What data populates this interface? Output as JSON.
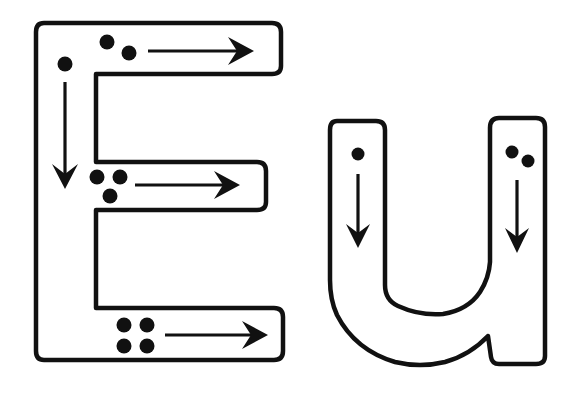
{
  "worksheet": {
    "title": "Letter tracing: E u",
    "colors": {
      "ink": "#111111",
      "paper": "#ffffff"
    },
    "letters": [
      {
        "char": "E",
        "case": "upper",
        "strokes": [
          {
            "order": 1,
            "direction": "down",
            "dots": 1
          },
          {
            "order": 2,
            "direction": "right",
            "dots": 2
          },
          {
            "order": 3,
            "direction": "right",
            "dots": 3
          },
          {
            "order": 4,
            "direction": "right",
            "dots": 4
          }
        ]
      },
      {
        "char": "u",
        "case": "lower",
        "strokes": [
          {
            "order": 1,
            "direction": "down",
            "dots": 1
          },
          {
            "order": 2,
            "direction": "down",
            "dots": 2
          }
        ]
      }
    ]
  }
}
